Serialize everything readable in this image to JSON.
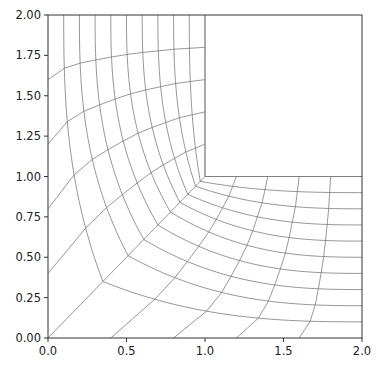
{
  "chart_data": {
    "type": "line",
    "title": "",
    "xlabel": "",
    "ylabel": "",
    "xlim": [
      0.0,
      2.0
    ],
    "ylim": [
      0.0,
      2.0
    ],
    "grid": false,
    "legend": null,
    "x_ticks": [
      "0.0",
      "0.5",
      "1.0",
      "1.5",
      "2.0"
    ],
    "x_tick_values": [
      0.0,
      0.5,
      1.0,
      1.5,
      2.0
    ],
    "y_ticks": [
      "0.00",
      "0.25",
      "0.50",
      "0.75",
      "1.00",
      "1.25",
      "1.50",
      "1.75",
      "2.00"
    ],
    "y_tick_values": [
      0.0,
      0.25,
      0.5,
      0.75,
      1.0,
      1.25,
      1.5,
      1.75,
      2.0
    ],
    "domain_outline": [
      [
        0,
        0
      ],
      [
        2,
        0
      ],
      [
        2,
        1
      ],
      [
        1,
        1
      ],
      [
        1,
        2
      ],
      [
        0,
        2
      ],
      [
        0,
        0
      ]
    ],
    "arc_lines": {
      "note": "L-shaped curves from top edge (t,2) bending around corner to right edge (2,t)",
      "t_values": [
        0.1,
        0.2,
        0.3,
        0.4,
        0.5,
        0.6,
        0.7,
        0.8,
        0.9,
        1.0
      ],
      "diagonal_crossing": [
        0.35,
        0.51,
        0.61,
        0.7,
        0.78,
        0.84,
        0.89,
        0.94,
        0.97,
        1.0
      ]
    },
    "radial_lines": {
      "note": "curves from left edge to notch edge x=1, mirrored from bottom edge to notch edge y=1",
      "left_edge_y": [
        1.6,
        1.2,
        0.8,
        0.4,
        0.0
      ],
      "notch_edge_y": [
        1.8,
        1.6,
        1.4,
        1.2,
        1.0
      ],
      "bottom_edge_x": [
        1.6,
        1.2,
        0.8,
        0.4,
        0.0
      ],
      "notch_edge_x": [
        1.8,
        1.6,
        1.4,
        1.2,
        1.0
      ]
    },
    "line_color": "#7a7a7a",
    "axes_color": "#333333"
  },
  "plot_area": {
    "left": 48,
    "top": 15,
    "right": 362,
    "bottom": 338
  }
}
